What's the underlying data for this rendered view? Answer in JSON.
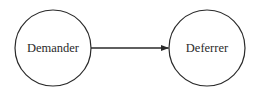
{
  "diagram": {
    "nodes": [
      {
        "id": "demander",
        "label": "Demander",
        "cx": 53,
        "cy": 48,
        "r": 38
      },
      {
        "id": "deferrer",
        "label": "Deferrer",
        "cx": 207,
        "cy": 48,
        "r": 38
      }
    ],
    "edges": [
      {
        "from": "demander",
        "to": "deferrer",
        "directed": true
      }
    ],
    "colors": {
      "stroke": "#2a2a2a",
      "text": "#2a2a2a",
      "background": "#ffffff"
    }
  }
}
